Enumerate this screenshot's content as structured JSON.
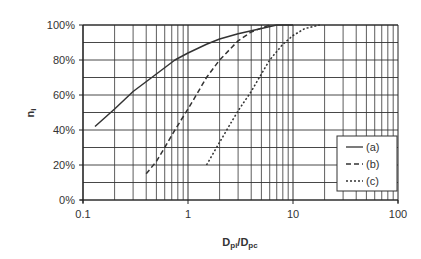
{
  "chart_data": {
    "type": "line",
    "title": "",
    "xlabel": "Dpi/Dpc",
    "xlabel_main": "D",
    "xlabel_sub1": "pi",
    "xlabel_mid": "/D",
    "xlabel_sub2": "pc",
    "ylabel": "ni",
    "ylabel_main": "n",
    "ylabel_sub": "i",
    "xscale": "log",
    "xlim": [
      0.1,
      100
    ],
    "ylim": [
      0,
      100
    ],
    "x_ticks": [
      "0.1",
      "1",
      "10",
      "100"
    ],
    "y_ticks": [
      "0%",
      "20%",
      "40%",
      "60%",
      "80%",
      "100%"
    ],
    "grid": true,
    "legend_position": "lower right",
    "series": [
      {
        "name": "(a)",
        "style": "solid",
        "x": [
          0.13,
          0.2,
          0.3,
          0.5,
          0.75,
          1.0,
          1.5,
          2.0,
          3.0,
          5.0,
          7.0,
          10.0
        ],
        "y": [
          42,
          52,
          62,
          72,
          80,
          84,
          89,
          92,
          95,
          98,
          100,
          100
        ]
      },
      {
        "name": "(b)",
        "style": "dashed",
        "x": [
          0.4,
          0.5,
          0.6,
          0.75,
          1.0,
          1.2,
          1.5,
          2.0,
          3.0,
          4.0,
          6.0
        ],
        "y": [
          15,
          22,
          30,
          40,
          52,
          60,
          70,
          80,
          91,
          96,
          100
        ]
      },
      {
        "name": "(c)",
        "style": "dotted",
        "x": [
          1.5,
          2.0,
          2.5,
          3.0,
          4.0,
          5.0,
          6.0,
          8.0,
          10.0,
          13.0,
          18.0
        ],
        "y": [
          20,
          33,
          43,
          51,
          62,
          72,
          80,
          89,
          94,
          98,
          100
        ]
      }
    ]
  }
}
